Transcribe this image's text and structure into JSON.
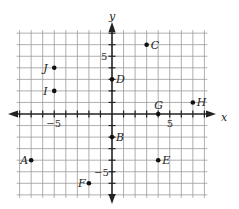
{
  "axes": {
    "x_label": "x",
    "y_label": "y",
    "x_tick_labels": [
      {
        "value": -5,
        "text": "−5"
      },
      {
        "value": 5,
        "text": "5"
      }
    ],
    "y_tick_labels": [
      {
        "value": 5,
        "text": "5"
      },
      {
        "value": -5,
        "text": "−5"
      }
    ],
    "x_range": [
      -8,
      8
    ],
    "y_range": [
      -7,
      7
    ]
  },
  "points": [
    {
      "label": "A",
      "x": -7,
      "y": -4,
      "label_side": "left"
    },
    {
      "label": "B",
      "x": 0,
      "y": -2,
      "label_side": "right"
    },
    {
      "label": "C",
      "x": 3,
      "y": 6,
      "label_side": "right"
    },
    {
      "label": "D",
      "x": 0,
      "y": 3,
      "label_side": "right"
    },
    {
      "label": "E",
      "x": 4,
      "y": -4,
      "label_side": "right"
    },
    {
      "label": "F",
      "x": -2,
      "y": -6,
      "label_side": "left"
    },
    {
      "label": "G",
      "x": 4,
      "y": 0,
      "label_side": "above"
    },
    {
      "label": "H",
      "x": 7,
      "y": 1,
      "label_side": "right"
    },
    {
      "label": "I",
      "x": -5,
      "y": 2,
      "label_side": "left"
    },
    {
      "label": "J",
      "x": -5,
      "y": 4,
      "label_side": "left"
    }
  ],
  "colors": {
    "grid": "#9a9a9a",
    "axis": "#222222",
    "point": "#111111"
  }
}
